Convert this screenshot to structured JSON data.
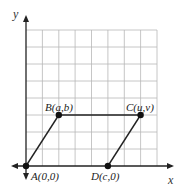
{
  "diagram": {
    "type": "coordinate-grid-parallelogram",
    "axes": {
      "x_label": "x",
      "y_label": "y"
    },
    "grid": {
      "columns": 8,
      "rows": 8,
      "color": "#b8b8b8"
    },
    "colors": {
      "axis": "#222222",
      "edge": "#222222",
      "point": "#111111"
    },
    "points": [
      {
        "id": "A",
        "label": "A(0,0)",
        "grid_x": 0,
        "grid_y": 0
      },
      {
        "id": "B",
        "label": "B(a,b)",
        "grid_x": 2,
        "grid_y": 3
      },
      {
        "id": "C",
        "label": "C(u,v)",
        "grid_x": 7,
        "grid_y": 3
      },
      {
        "id": "D",
        "label": "D(c,0)",
        "grid_x": 5,
        "grid_y": 0
      }
    ],
    "edges": [
      [
        "A",
        "B"
      ],
      [
        "B",
        "C"
      ],
      [
        "D",
        "C"
      ]
    ]
  }
}
